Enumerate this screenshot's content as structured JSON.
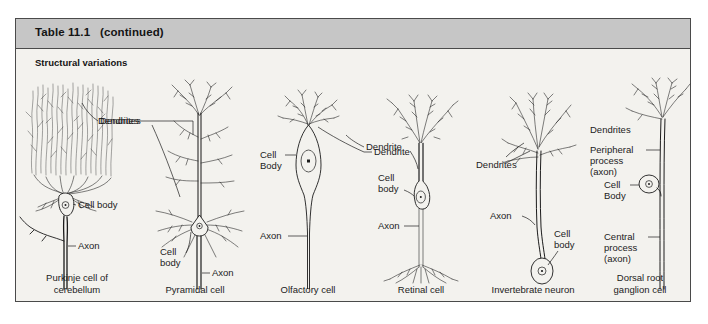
{
  "figure": {
    "table_title": "Table 11.1   (continued)",
    "section_heading": "Structural variations",
    "frame_border_color": "#4a4a4a",
    "header_band_color": "#c6c6c6",
    "background_color": "#f3f2ee",
    "ink_color": "#1c1c1c"
  },
  "panels": [
    {
      "id": "purkinje",
      "caption": "Purkinje cell of\ncerebellum",
      "caption_line1": "Purkinje cell of",
      "caption_line2": "cerebellum",
      "labels": {
        "dendrites": "Dendrites",
        "cell_body": "Cell body",
        "axon": "Axon"
      }
    },
    {
      "id": "pyramidal",
      "caption": "Pyramidal cell",
      "caption_line1": "Pyramidal cell",
      "caption_line2": "",
      "labels": {
        "dendrites": "Dendrites",
        "cell_body_line1": "Cell",
        "cell_body_line2": "body",
        "axon": "Axon"
      }
    },
    {
      "id": "olfactory",
      "caption": "Olfactory cell",
      "caption_line1": "Olfactory cell",
      "caption_line2": "",
      "labels": {
        "cell_body_line1": "Cell",
        "cell_body_line2": "Body",
        "dendrite": "Dendrite",
        "axon": "Axon"
      }
    },
    {
      "id": "retinal",
      "caption": "Retinal cell",
      "caption_line1": "Retinal cell",
      "caption_line2": "",
      "labels": {
        "dendrite": "Dendrite",
        "cell_body_line1": "Cell",
        "cell_body_line2": "body",
        "axon": "Axon"
      }
    },
    {
      "id": "invertebrate",
      "caption": "Invertebrate neuron",
      "caption_line1": "Invertebrate neuron",
      "caption_line2": "",
      "labels": {
        "dendrites": "Dendrites",
        "axon": "Axon",
        "cell_body_line1": "Cell",
        "cell_body_line2": "body"
      }
    },
    {
      "id": "dorsal-root-ganglion",
      "caption": "Dorsal root\nganglion cell",
      "caption_line1": "Dorsal root",
      "caption_line2": "ganglion cell",
      "labels": {
        "dendrites": "Dendrites",
        "peripheral_line1": "Peripheral",
        "peripheral_line2": "process",
        "peripheral_line3": "(axon)",
        "cell_body_line1": "Cell",
        "cell_body_line2": "Body",
        "central_line1": "Central",
        "central_line2": "process",
        "central_line3": "(axon)"
      }
    }
  ]
}
